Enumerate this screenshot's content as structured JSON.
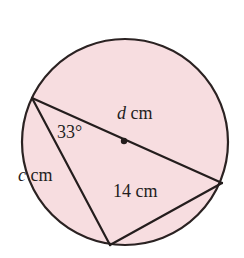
{
  "figure": {
    "kind": "circle-geometry-diagram",
    "background_color": "#ffffff",
    "circle": {
      "fill_color": "#f7dde0",
      "stroke_color": "#2b2222",
      "stroke_width": 2.2,
      "center_x": 125,
      "center_y": 142,
      "radius": 103,
      "center_dot": {
        "x": 124,
        "y": 141,
        "radius": 3.2,
        "color": "#241d1d"
      }
    },
    "points": {
      "left": {
        "x": 32,
        "y": 98
      },
      "right": {
        "x": 222,
        "y": 183
      },
      "bottom": {
        "x": 110,
        "y": 245
      }
    },
    "segments": [
      {
        "name": "diameter",
        "from": "left",
        "to": "right",
        "label": "d cm"
      },
      {
        "name": "chord-left-bottom",
        "from": "left",
        "to": "bottom",
        "label": "c cm"
      },
      {
        "name": "chord-bottom-right",
        "from": "bottom",
        "to": "right",
        "label": "14 cm"
      }
    ],
    "stroke_color": "#241d1d",
    "stroke_width": 2.2
  },
  "labels": {
    "diameter": {
      "variable": "d",
      "unit": "cm"
    },
    "angle": {
      "value": "33°"
    },
    "chord_c": {
      "variable": "c",
      "unit": "cm"
    },
    "chord_14": {
      "value": "14",
      "unit": "cm"
    }
  }
}
